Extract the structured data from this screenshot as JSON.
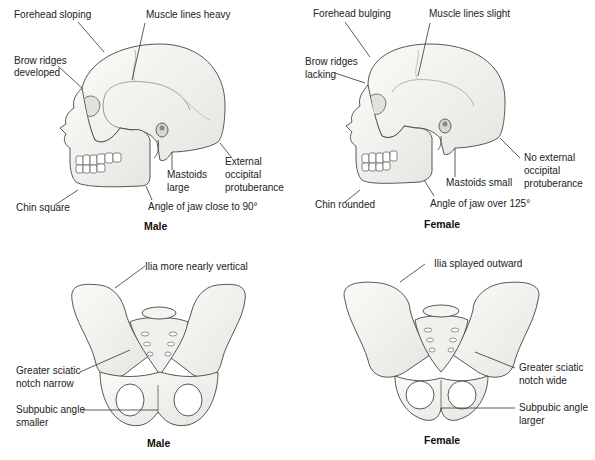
{
  "skulls": {
    "male": {
      "caption": "Male",
      "labels": {
        "forehead": "Forehead sloping",
        "muscle": "Muscle lines heavy",
        "brow_1": "Brow ridges",
        "brow_2": "developed",
        "mastoid_1": "Mastoids",
        "mastoid_2": "large",
        "occipital_1": "External",
        "occipital_2": "occipital",
        "occipital_3": "protuberance",
        "chin": "Chin square",
        "jaw": "Angle of jaw close to 90°"
      }
    },
    "female": {
      "caption": "Female",
      "labels": {
        "forehead": "Forehead bulging",
        "muscle": "Muscle lines slight",
        "brow_1": "Brow ridges",
        "brow_2": "lacking",
        "mastoid": "Mastoids small",
        "occipital_1": "No external",
        "occipital_2": "occipital",
        "occipital_3": "protuberance",
        "chin": "Chin rounded",
        "jaw": "Angle of jaw over 125°"
      }
    }
  },
  "pelves": {
    "male": {
      "caption": "Male",
      "labels": {
        "ilia": "Ilia more nearly vertical",
        "sciatic_1": "Greater sciatic",
        "sciatic_2": "notch narrow",
        "subpubic_1": "Subpubic angle",
        "subpubic_2": "smaller"
      }
    },
    "female": {
      "caption": "Female",
      "labels": {
        "ilia": "Ilia splayed outward",
        "sciatic_1": "Greater sciatic",
        "sciatic_2": "notch wide",
        "subpubic_1": "Subpubic angle",
        "subpubic_2": "larger"
      }
    }
  },
  "colors": {
    "bone_fill": "#f2f2ee",
    "bone_shade": "#d6d6d0",
    "outline": "#444444",
    "leader": "#333333"
  }
}
